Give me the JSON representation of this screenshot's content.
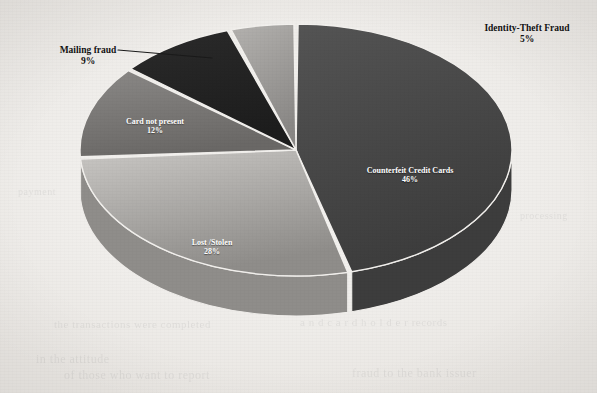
{
  "chart_data": {
    "type": "pie",
    "title": "",
    "three_d": true,
    "legend_position": "none",
    "labels_show_percent": true,
    "categories": [
      "Counterfeit Credit Cards",
      "Lost /Stolen",
      "Card not present",
      "Mailing fraud",
      "Identity-Theft Fraud"
    ],
    "values": [
      46,
      28,
      12,
      9,
      5
    ],
    "unit": "%",
    "slices": [
      {
        "label": "Counterfeit Credit Cards",
        "percent": 46,
        "percent_text": "46%",
        "color": "#545454",
        "color_dark": "#3d3d3d",
        "label_placement": "inside",
        "label_style": "inside-light",
        "label_x": 410,
        "label_y": 167
      },
      {
        "label": "Lost /Stolen",
        "percent": 28,
        "percent_text": "28%",
        "color": "#c9c7c4",
        "color_dark": "#8f8d8a",
        "label_placement": "inside",
        "label_style": "inside-light",
        "label_x": 212,
        "label_y": 239
      },
      {
        "label": "Card not present",
        "percent": 12,
        "percent_text": "12%",
        "color": "#8b8987",
        "color_dark": "#6a6866",
        "label_placement": "inside",
        "label_style": "inside-dark",
        "label_x": 155,
        "label_y": 118
      },
      {
        "label": "Mailing fraud",
        "percent": 9,
        "percent_text": "9%",
        "color": "#2b2b2b",
        "color_dark": "#1d1d1d",
        "label_placement": "outside",
        "label_style": "outside",
        "label_x": 88,
        "label_y": 45
      },
      {
        "label": "Identity-Theft Fraud",
        "percent": 5,
        "percent_text": "5%",
        "color": "#b4b2af",
        "color_dark": "#8a8886",
        "label_placement": "outside",
        "label_style": "outside",
        "label_x": 527,
        "label_y": 23
      }
    ],
    "geometry": {
      "cx": 296,
      "cy": 150,
      "rx": 216,
      "ry": 126,
      "depth": 40,
      "start_angle_deg": -90,
      "direction": "clockwise",
      "gap_deg": 1.1
    },
    "leader_line": {
      "for": "Mailing fraud",
      "from_x": 118,
      "from_y": 50,
      "to_x": 212,
      "to_y": 58,
      "color": "#1a1a1a"
    }
  },
  "background": {
    "paper_color": "#f2f0ed",
    "bleed_texts": [
      {
        "text": "the transactions were completed",
        "x": 54,
        "y": 318,
        "size": 11
      },
      {
        "text": "a n d   c a r d h o l d e r  records",
        "x": 300,
        "y": 316,
        "size": 11
      },
      {
        "text": "in the  attitude",
        "x": 36,
        "y": 352,
        "size": 12
      },
      {
        "text": "of those who want to report",
        "x": 64,
        "y": 368,
        "size": 12
      },
      {
        "text": "fraud to the bank issuer",
        "x": 352,
        "y": 366,
        "size": 12
      },
      {
        "text": "payment",
        "x": 18,
        "y": 186,
        "size": 10
      },
      {
        "text": "processing",
        "x": 520,
        "y": 210,
        "size": 10
      }
    ]
  }
}
